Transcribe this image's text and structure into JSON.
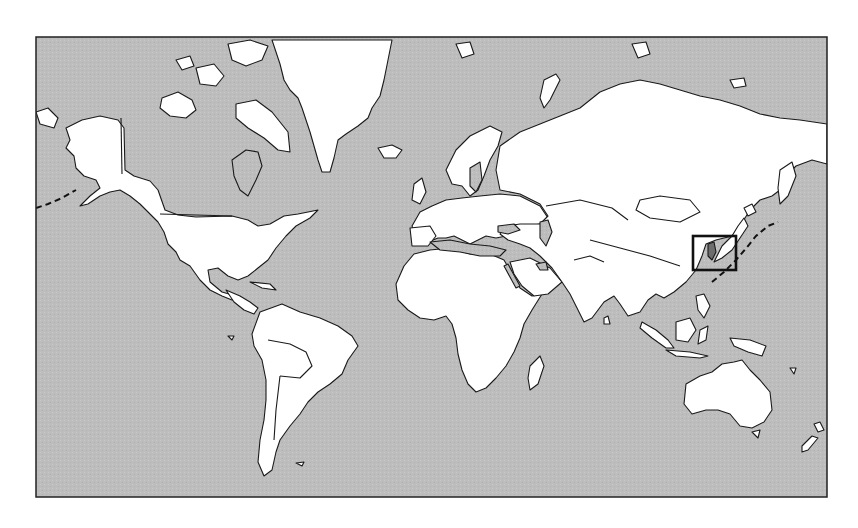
{
  "figure": {
    "type": "world-locator-map",
    "projection": "mercator",
    "width": 858,
    "height": 528
  },
  "colors": {
    "page_background": "#ffffff",
    "ocean": "#bdbdbd",
    "land": "#ffffff",
    "border_stroke": "#1a1a1a",
    "highlight_fill": "#6e6e6e",
    "frame_stroke": "#222222",
    "locator_box_stroke": "#111111",
    "dateline": "#111111"
  },
  "frame": {
    "x": 36,
    "y": 37,
    "width": 791,
    "height": 460,
    "stroke_width": 1.5
  },
  "locator_box": {
    "label": "",
    "region": "Korea / Japan",
    "x": 693,
    "y": 236,
    "width": 43,
    "height": 34,
    "stroke_width": 2.6
  },
  "highlighted_country": {
    "name": "Korea",
    "shade": "dark-gray"
  },
  "date_line": {
    "style": "dashed",
    "visible": true
  },
  "continents": [
    {
      "name": "North America"
    },
    {
      "name": "Greenland"
    },
    {
      "name": "South America"
    },
    {
      "name": "Europe"
    },
    {
      "name": "Africa"
    },
    {
      "name": "Asia"
    },
    {
      "name": "Australia"
    },
    {
      "name": "New Zealand"
    },
    {
      "name": "Iceland"
    },
    {
      "name": "Madagascar"
    },
    {
      "name": "Japan"
    }
  ],
  "text_labels": []
}
